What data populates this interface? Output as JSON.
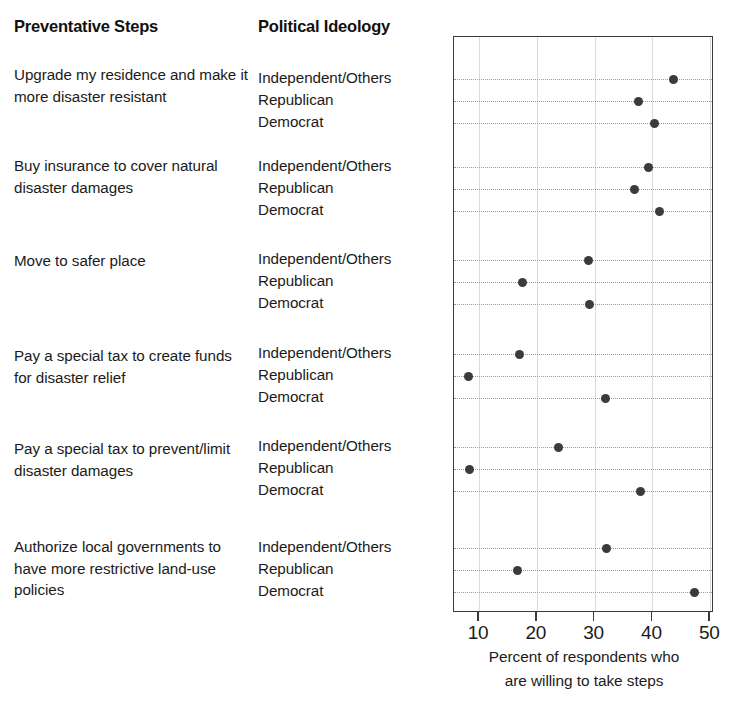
{
  "headers": {
    "steps": "Preventative Steps",
    "ideology": "Political Ideology"
  },
  "axis": {
    "title_line1": "Percent of respondents who",
    "title_line2": "are willing to take steps",
    "ticks": [
      "10",
      "20",
      "30",
      "40",
      "50"
    ]
  },
  "groups": [
    {
      "step": "Upgrade my residence and make it more disaster resistant",
      "rows": [
        {
          "ideology": "Independent/Others",
          "value": 43.7
        },
        {
          "ideology": "Republican",
          "value": 37.6
        },
        {
          "ideology": "Democrat",
          "value": 40.4
        }
      ]
    },
    {
      "step": "Buy insurance to cover natural disaster damages",
      "rows": [
        {
          "ideology": "Independent/Others",
          "value": 39.3
        },
        {
          "ideology": "Republican",
          "value": 36.9
        },
        {
          "ideology": "Democrat",
          "value": 41.2
        }
      ]
    },
    {
      "step": "Move to safer place",
      "rows": [
        {
          "ideology": "Independent/Others",
          "value": 28.9
        },
        {
          "ideology": "Republican",
          "value": 17.5
        },
        {
          "ideology": "Democrat",
          "value": 29.1
        }
      ]
    },
    {
      "step": "Pay a special tax to create funds for disaster relief",
      "rows": [
        {
          "ideology": "Independent/Others",
          "value": 17.0
        },
        {
          "ideology": "Republican",
          "value": 8.1
        },
        {
          "ideology": "Democrat",
          "value": 31.9
        }
      ]
    },
    {
      "step": "Pay a special tax to prevent/limit disaster damages",
      "rows": [
        {
          "ideology": "Independent/Others",
          "value": 23.7
        },
        {
          "ideology": "Republican",
          "value": 8.3
        },
        {
          "ideology": "Democrat",
          "value": 38.0
        }
      ]
    },
    {
      "step": "Authorize local governments to have more restrictive land-use policies",
      "rows": [
        {
          "ideology": "Independent/Others",
          "value": 32.0
        },
        {
          "ideology": "Republican",
          "value": 16.6
        },
        {
          "ideology": "Democrat",
          "value": 47.2
        }
      ]
    }
  ],
  "chart_data": {
    "type": "scatter",
    "title": "",
    "xlabel": "Percent of respondents who are willing to take steps",
    "ylabel": "",
    "xlim": [
      5.75,
      53.9
    ],
    "xticks": [
      10,
      20,
      30,
      40,
      50
    ],
    "grid": true,
    "legend": "none",
    "dot_color": "#3b3b3b",
    "categories": [
      "Upgrade my residence and make it more disaster resistant — Independent/Others",
      "Upgrade my residence and make it more disaster resistant — Republican",
      "Upgrade my residence and make it more disaster resistant — Democrat",
      "Buy insurance to cover natural disaster damages — Independent/Others",
      "Buy insurance to cover natural disaster damages — Republican",
      "Buy insurance to cover natural disaster damages — Democrat",
      "Move to safer place — Independent/Others",
      "Move to safer place — Republican",
      "Move to safer place — Democrat",
      "Pay a special tax to create funds for disaster relief — Independent/Others",
      "Pay a special tax to create funds for disaster relief — Republican",
      "Pay a special tax to create funds for disaster relief — Democrat",
      "Pay a special tax to prevent/limit disaster damages — Independent/Others",
      "Pay a special tax to prevent/limit disaster damages — Republican",
      "Pay a special tax to prevent/limit disaster damages — Democrat",
      "Authorize local governments to have more restrictive land-use policies — Independent/Others",
      "Authorize local governments to have more restrictive land-use policies — Republican",
      "Authorize local governments to have more restrictive land-use policies — Democrat"
    ],
    "values": [
      43.7,
      37.6,
      40.4,
      39.3,
      36.9,
      41.2,
      28.9,
      17.5,
      29.1,
      17.0,
      8.1,
      31.9,
      23.7,
      8.3,
      38.0,
      32.0,
      16.6,
      47.2
    ]
  },
  "layout": {
    "plot": {
      "left": 453,
      "top": 36,
      "width": 260,
      "height": 576
    },
    "x_pixel_at_10": 478,
    "px_per_unit": 5.78,
    "group_step_tops": [
      64,
      155,
      250,
      345,
      438,
      536
    ],
    "row_y": [
      [
        78,
        100,
        122
      ],
      [
        166,
        188,
        210
      ],
      [
        259,
        281,
        303
      ],
      [
        353,
        375,
        397
      ],
      [
        446,
        468,
        490
      ],
      [
        547,
        569,
        591
      ]
    ]
  }
}
